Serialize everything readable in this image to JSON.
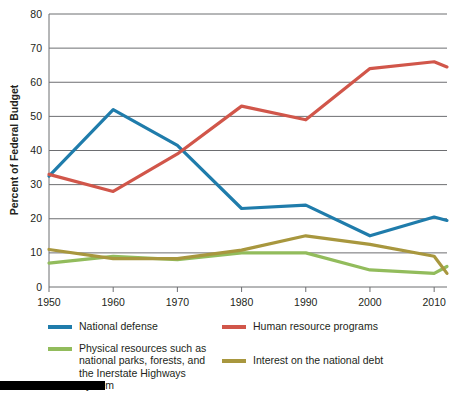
{
  "chart_data": {
    "type": "line",
    "title": "",
    "xlabel": "",
    "ylabel": "Percent of Federal Budget",
    "xlim": [
      1950,
      2012
    ],
    "ylim": [
      0,
      80
    ],
    "ytick_step": 10,
    "yticks": [
      0,
      10,
      20,
      30,
      40,
      50,
      60,
      70,
      80
    ],
    "xticks": [
      1950,
      1960,
      1970,
      1980,
      1990,
      2000,
      2010
    ],
    "ytick_labels": [
      "0",
      "10",
      "20",
      "30",
      "40",
      "50",
      "60",
      "70",
      "80"
    ],
    "xtick_labels": [
      "1950",
      "1960",
      "1970",
      "1980",
      "1990",
      "2000",
      "2010"
    ],
    "grid": "horizontal",
    "legend_position": "below",
    "x": [
      1950,
      1960,
      1970,
      1980,
      1990,
      2000,
      2010,
      2012
    ],
    "series": [
      {
        "name": "National defense",
        "color": "#1f7cab",
        "values": [
          32.5,
          52.0,
          41.5,
          23.0,
          24.0,
          15.0,
          20.5,
          19.5
        ]
      },
      {
        "name": "Human resource programs",
        "color": "#d1564a",
        "values": [
          33.0,
          28.0,
          39.0,
          53.0,
          49.0,
          64.0,
          66.0,
          64.5
        ]
      },
      {
        "name": "Physical resources such as\nnational parks, forests, and\nthe Inerstate Highways System",
        "color": "#92bc5c",
        "values": [
          7.0,
          9.0,
          8.0,
          10.0,
          10.0,
          5.0,
          4.0,
          6.0
        ]
      },
      {
        "name": "Interest on the national debt",
        "color": "#a8973e",
        "values": [
          11.0,
          8.3,
          8.3,
          10.8,
          15.0,
          12.5,
          9.0,
          4.0
        ]
      }
    ]
  },
  "axes": {
    "y_title": "Percent of Federal Budget"
  },
  "legend": {
    "entries": [
      {
        "label": "National defense",
        "color": "#1f7cab"
      },
      {
        "label": "Human resource programs",
        "color": "#d1564a"
      },
      {
        "label": "Physical resources such as\nnational parks, forests, and\nthe Inerstate Highways System",
        "color": "#92bc5c"
      },
      {
        "label": "Interest on the national debt",
        "color": "#a8973e"
      }
    ]
  }
}
